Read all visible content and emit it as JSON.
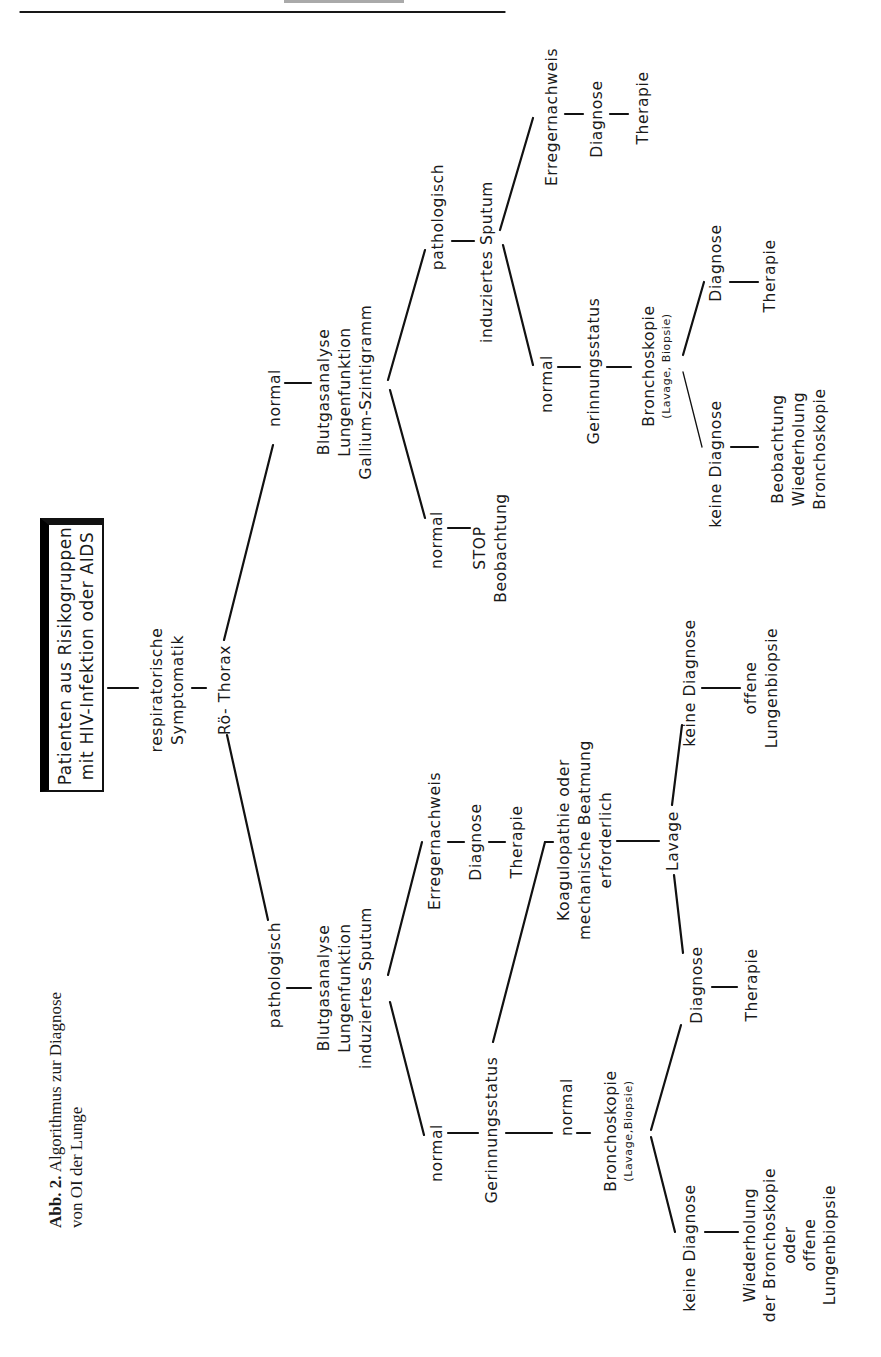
{
  "header": {
    "page_rule": true
  },
  "caption": {
    "label": "Abb. 2.",
    "line1": "Algorithmus zur Diagnose",
    "line2": "von OI der Lunge"
  },
  "title_box": {
    "line1": "Patienten aus Risikogruppen",
    "line2": "mit HIV-Infektion oder AIDS"
  },
  "root": {
    "symptom_line1": "respiratorische",
    "symptom_line2": "Symptomatik",
    "xray": "Rö- Thorax"
  },
  "branch_normal": {
    "label": "normal",
    "tests_line1": "Blutgasanalyse",
    "tests_line2": "Lungenfunktion",
    "tests_line3": "Gallium-Szintigramm",
    "normal": {
      "label": "normal",
      "stop": "STOP",
      "observation": "Beobachtung"
    },
    "pathologic": {
      "label": "pathologisch",
      "sputum": "induziertes Sputum",
      "pathogen": "Erregernachweis",
      "diagnosis": "Diagnose",
      "therapy": "Therapie",
      "normal": "normal",
      "coag": "Gerinnungsstatus",
      "broncho": "Bronchoskopie",
      "broncho_sub": "(Lavage, Biopsie)",
      "dx": "Diagnose",
      "tx": "Therapie",
      "no_dx": "keine Diagnose",
      "followup_line1": "Beobachtung",
      "followup_line2": "Wiederholung",
      "followup_line3": "Bronchoskopie"
    }
  },
  "branch_pathologic": {
    "label": "pathologisch",
    "tests_line1": "Blutgasanalyse",
    "tests_line2": "Lungenfunktion",
    "tests_line3": "induziertes Sputum",
    "pathogen": "Erregernachweis",
    "diagnosis": "Diagnose",
    "therapy": "Therapie",
    "normal": "normal",
    "coag": "Gerinnungsstatus",
    "coag_abnormal_line1": "Koagulopathie oder",
    "coag_abnormal_line2": "mechanische Beatmung",
    "coag_abnormal_line3": "erforderlich",
    "lavage": "Lavage",
    "lavage_dx": "Diagnose",
    "lavage_tx": "Therapie",
    "lavage_no_dx": "keine Diagnose",
    "lavage_open_line1": "offene",
    "lavage_open_line2": "Lungenbiopsie",
    "coag_normal": "normal",
    "broncho": "Bronchoskopie",
    "broncho_sub": "(Lavage,Biopsie)",
    "broncho_dx": "Diagnose",
    "broncho_tx": "Therapie",
    "broncho_no_dx": "keine Diagnose",
    "repeat_line1": "Wiederholung",
    "repeat_line2": "der Bronchoskopie",
    "repeat_line3": "oder",
    "repeat_line4": "offene",
    "repeat_line5": "Lungenbiopsie"
  }
}
